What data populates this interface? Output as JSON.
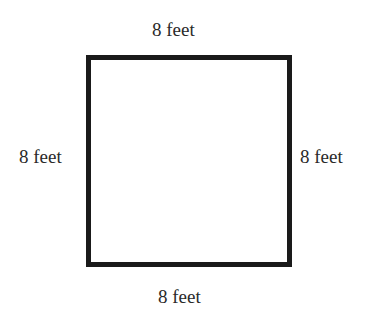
{
  "diagram": {
    "shape": "square",
    "side_length": 8,
    "unit": "feet",
    "labels": {
      "top": "8 feet",
      "left": "8 feet",
      "right": "8 feet",
      "bottom": "8 feet"
    }
  }
}
